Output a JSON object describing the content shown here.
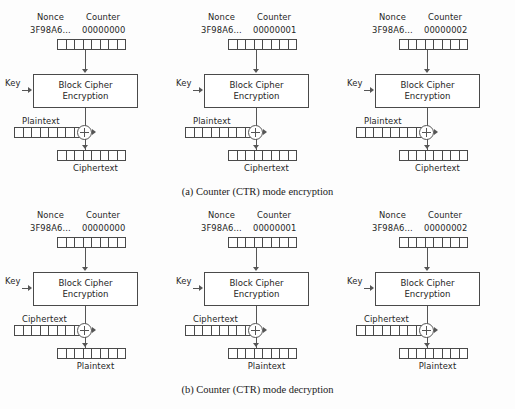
{
  "figure": {
    "background_color": "#fdfdfd",
    "line_color": "#555555",
    "text_color": "#262626"
  },
  "labels": {
    "nonce_title": "Nonce",
    "counter_title": "Counter",
    "nonce_value": "3F98A6...",
    "key": "Key",
    "cipher_line1": "Block Cipher",
    "cipher_line2": "Encryption",
    "plaintext": "Plaintext",
    "ciphertext": "Ciphertext",
    "xor_symbol": "⊕"
  },
  "sections": [
    {
      "id": "encryption",
      "caption": "(a)  Counter (CTR) mode encryption",
      "input_label": "Plaintext",
      "output_label": "Ciphertext",
      "panels": [
        {
          "index": 0,
          "nonce_title": "Nonce",
          "counter_title": "Counter",
          "nonce_value": "3F98A6...",
          "counter_value": "00000000",
          "key_label": "Key",
          "cipher_line1": "Block Cipher",
          "cipher_line2": "Encryption",
          "input_label": "Plaintext",
          "output_label": "Ciphertext",
          "cells": 8
        },
        {
          "index": 1,
          "nonce_title": "Nonce",
          "counter_title": "Counter",
          "nonce_value": "3F98A6...",
          "counter_value": "00000001",
          "key_label": "Key",
          "cipher_line1": "Block Cipher",
          "cipher_line2": "Encryption",
          "input_label": "Plaintext",
          "output_label": "Ciphertext",
          "cells": 8
        },
        {
          "index": 2,
          "nonce_title": "Nonce",
          "counter_title": "Counter",
          "nonce_value": "3F98A6...",
          "counter_value": "00000002",
          "key_label": "Key",
          "cipher_line1": "Block Cipher",
          "cipher_line2": "Encryption",
          "input_label": "Plaintext",
          "output_label": "Ciphertext",
          "cells": 8
        }
      ]
    },
    {
      "id": "decryption",
      "caption": "(b)  Counter (CTR) mode decryption",
      "input_label": "Ciphertext",
      "output_label": "Plaintext",
      "panels": [
        {
          "index": 0,
          "nonce_title": "Nonce",
          "counter_title": "Counter",
          "nonce_value": "3F98A6...",
          "counter_value": "00000000",
          "key_label": "Key",
          "cipher_line1": "Block Cipher",
          "cipher_line2": "Encryption",
          "input_label": "Ciphertext",
          "output_label": "Plaintext",
          "cells": 8
        },
        {
          "index": 1,
          "nonce_title": "Nonce",
          "counter_title": "Counter",
          "nonce_value": "3F98A6...",
          "counter_value": "00000001",
          "key_label": "Key",
          "cipher_line1": "Block Cipher",
          "cipher_line2": "Encryption",
          "input_label": "Ciphertext",
          "output_label": "Plaintext",
          "cells": 8
        },
        {
          "index": 2,
          "nonce_title": "Nonce",
          "counter_title": "Counter",
          "nonce_value": "3F98A6...",
          "counter_value": "00000002",
          "key_label": "Key",
          "cipher_line1": "Block Cipher",
          "cipher_line2": "Encryption",
          "input_label": "Ciphertext",
          "output_label": "Plaintext",
          "cells": 8
        }
      ]
    }
  ]
}
